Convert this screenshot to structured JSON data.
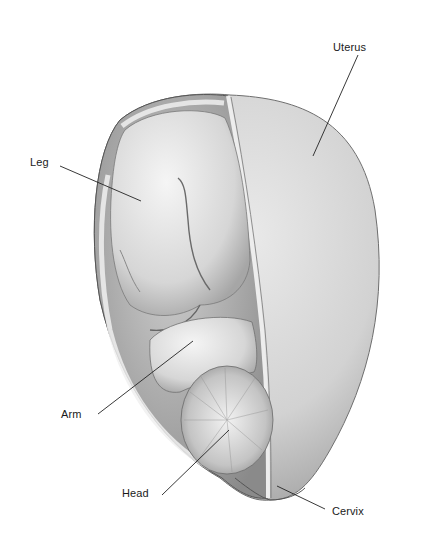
{
  "figure": {
    "labels": [
      {
        "id": "uterus",
        "text": "Uterus",
        "x": 333,
        "y": 41,
        "line": [
          358,
          55,
          313,
          156
        ]
      },
      {
        "id": "leg",
        "text": "Leg",
        "x": 30,
        "y": 156,
        "line": [
          60,
          166,
          141,
          201
        ]
      },
      {
        "id": "arm",
        "text": "Arm",
        "x": 61,
        "y": 408,
        "line": [
          98,
          414,
          193,
          341
        ]
      },
      {
        "id": "head",
        "text": "Head",
        "x": 122,
        "y": 487,
        "line": [
          162,
          495,
          229,
          430
        ]
      },
      {
        "id": "cervix",
        "text": "Cervix",
        "x": 332,
        "y": 505,
        "line": [
          325,
          509,
          277,
          486
        ]
      }
    ]
  }
}
